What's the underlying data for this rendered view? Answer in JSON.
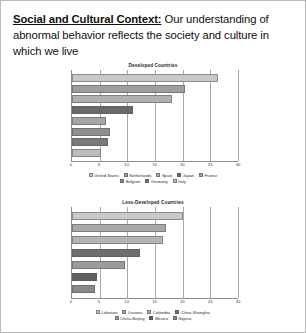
{
  "slide": {
    "headline_lead": "Social and Cultural Context:",
    "headline_rest": " Our understanding of abnormal behavior reflects the society and culture in which we live"
  },
  "chart_data": [
    {
      "id": "developed",
      "type": "bar",
      "orientation": "horizontal",
      "title": "Developed Countries",
      "xlabel": "",
      "ylabel": "",
      "xlim": [
        0,
        30
      ],
      "ticks": [
        0,
        5,
        10,
        15,
        20,
        25,
        30
      ],
      "grid": true,
      "legend_position": "bottom",
      "categories": [
        "United States",
        "Netherlands",
        "Spain",
        "Japan",
        "France",
        "Belgium",
        "Germany",
        "Italy"
      ],
      "values": [
        26.4,
        20.5,
        18.0,
        11.0,
        6.2,
        6.8,
        6.5,
        5.2
      ],
      "colors": [
        "#c9c9c9",
        "#9e9e9e",
        "#b0b0b0",
        "#6a6a6a",
        "#a5a5a5",
        "#8f8f8f",
        "#7a7a7a",
        "#bdbdbd"
      ]
    },
    {
      "id": "less-developed",
      "type": "bar",
      "orientation": "horizontal",
      "title": "Less-Developed Countries",
      "xlabel": "",
      "ylabel": "",
      "xlim": [
        0,
        30
      ],
      "ticks": [
        0,
        5,
        10,
        15,
        20,
        25,
        30
      ],
      "grid": true,
      "legend_position": "bottom",
      "categories": [
        "Lebanon",
        "Lituania",
        "Colombia",
        "China-Shanghai",
        "China-Beijing",
        "Mexico",
        "Nigeria"
      ],
      "values": [
        20.0,
        17.0,
        16.5,
        12.3,
        9.5,
        4.6,
        4.1
      ],
      "colors": [
        "#c9c9c9",
        "#a8a8a8",
        "#b4b4b4",
        "#6e6e6e",
        "#9c9c9c",
        "#5f5f5f",
        "#8a8a8a"
      ]
    }
  ]
}
